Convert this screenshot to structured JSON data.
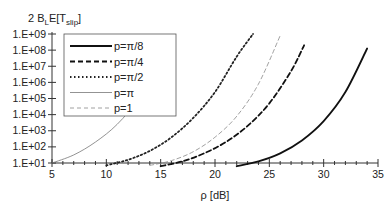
{
  "chart_data": {
    "type": "line",
    "title": "",
    "ylabel": "2 B_L E[T_slip]",
    "ylabel_parts": {
      "main": "2 B",
      "sub1": "L",
      "mid": "E[T",
      "sub2": "slip",
      "end": "]"
    },
    "xlabel": "ρ [dB]",
    "xlim": [
      5,
      35
    ],
    "ylim_log10": [
      1,
      9
    ],
    "yscale": "log",
    "x_ticks": [
      5,
      10,
      15,
      20,
      25,
      30,
      35
    ],
    "x_tick_labels": [
      "5",
      "10",
      "15",
      "20",
      "25",
      "30",
      "35"
    ],
    "y_ticks_log10": [
      1,
      2,
      3,
      4,
      5,
      6,
      7,
      8,
      9
    ],
    "y_tick_labels": [
      "1.E+01",
      "1.E+02",
      "1.E+03",
      "1.E+04",
      "1.E+05",
      "1.E+06",
      "1.E+07",
      "1.E+08",
      "1.E+09"
    ],
    "grid": false,
    "legend_position": "upper-left-inside",
    "series": [
      {
        "name": "p=π/8",
        "style": "solid-thick",
        "color": "#111111",
        "x": [
          22,
          24,
          26,
          28,
          30,
          32,
          34
        ],
        "log10_y": [
          0.8,
          1.1,
          1.6,
          2.4,
          3.6,
          5.4,
          8.1
        ]
      },
      {
        "name": "p=π/4",
        "style": "dashed-thick",
        "color": "#111111",
        "x": [
          15,
          17,
          19,
          21,
          23,
          25,
          27,
          28.2
        ],
        "log10_y": [
          0.8,
          1.1,
          1.6,
          2.3,
          3.3,
          4.7,
          6.7,
          8.3
        ]
      },
      {
        "name": "p=π/2",
        "style": "dotted",
        "color": "#222222",
        "x": [
          10,
          12,
          14,
          16,
          18,
          20,
          22,
          23.5
        ],
        "log10_y": [
          0.85,
          1.2,
          1.75,
          2.6,
          3.8,
          5.4,
          7.6,
          9.0
        ]
      },
      {
        "name": "p=π",
        "style": "solid-thin",
        "color": "#777777",
        "x": [
          5,
          7,
          9,
          11,
          13,
          15,
          16
        ],
        "log10_y": [
          1.0,
          1.5,
          2.3,
          3.4,
          5.0,
          7.2,
          8.8
        ]
      },
      {
        "name": "p=1",
        "style": "dashed-thin",
        "color": "#888888",
        "x": [
          14,
          16,
          18,
          20,
          22,
          24,
          26
        ],
        "log10_y": [
          0.85,
          1.15,
          1.7,
          2.6,
          3.9,
          5.9,
          8.9
        ]
      }
    ]
  }
}
